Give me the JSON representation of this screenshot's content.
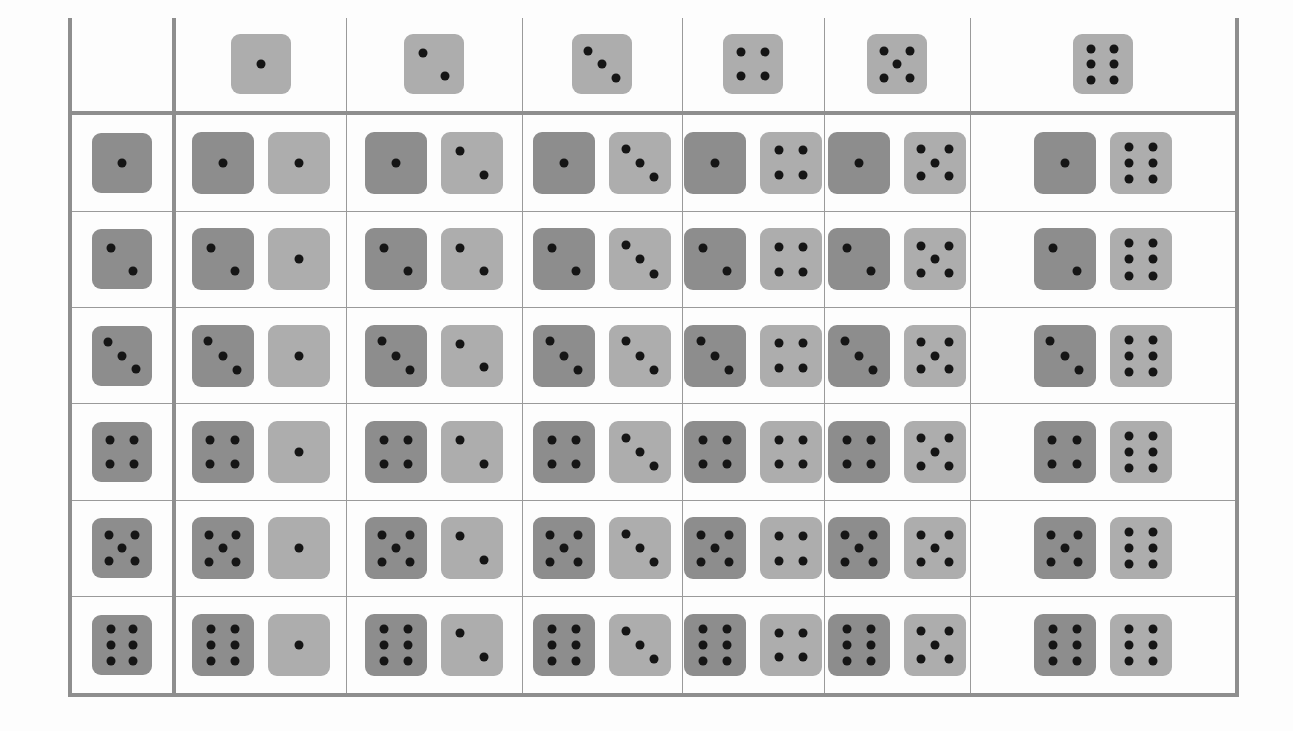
{
  "figure": {
    "kind": "dice-sample-space-table",
    "rows": 6,
    "columns": 6,
    "row_header_label": "first-die",
    "column_header_label": "second-die"
  },
  "colors": {
    "die_first": "#8d8d8d",
    "die_second": "#adadad",
    "pip": "#151515",
    "grid_thick": "#8e8e8e",
    "grid_thin": "#9a9a9a",
    "background": "#fdfdfd"
  },
  "pip_layouts": {
    "1": [
      [
        50,
        50
      ]
    ],
    "2": [
      [
        31,
        31
      ],
      [
        69,
        69
      ]
    ],
    "3": [
      [
        27,
        27
      ],
      [
        50,
        50
      ],
      [
        73,
        73
      ]
    ],
    "4": [
      [
        30,
        30
      ],
      [
        70,
        30
      ],
      [
        30,
        70
      ],
      [
        70,
        70
      ]
    ],
    "5": [
      [
        28,
        28
      ],
      [
        72,
        28
      ],
      [
        50,
        50
      ],
      [
        28,
        72
      ],
      [
        72,
        72
      ]
    ],
    "6": [
      [
        31,
        24
      ],
      [
        69,
        24
      ],
      [
        31,
        50
      ],
      [
        69,
        50
      ],
      [
        31,
        76
      ],
      [
        69,
        76
      ]
    ]
  },
  "column_headers": [
    {
      "name": "column-header-1",
      "value": 1,
      "shade": "light"
    },
    {
      "name": "column-header-2",
      "value": 2,
      "shade": "light"
    },
    {
      "name": "column-header-3",
      "value": 3,
      "shade": "light"
    },
    {
      "name": "column-header-4",
      "value": 4,
      "shade": "light"
    },
    {
      "name": "column-header-5",
      "value": 5,
      "shade": "light"
    },
    {
      "name": "column-header-6",
      "value": 6,
      "shade": "light"
    }
  ],
  "row_headers": [
    {
      "name": "row-header-1",
      "value": 1,
      "shade": "dark"
    },
    {
      "name": "row-header-2",
      "value": 2,
      "shade": "dark"
    },
    {
      "name": "row-header-3",
      "value": 3,
      "shade": "dark"
    },
    {
      "name": "row-header-4",
      "value": 4,
      "shade": "dark"
    },
    {
      "name": "row-header-5",
      "value": 5,
      "shade": "dark"
    },
    {
      "name": "row-header-6",
      "value": 6,
      "shade": "dark"
    }
  ],
  "cells": [
    [
      {
        "first": 1,
        "second": 1,
        "sum": 2
      },
      {
        "first": 1,
        "second": 2,
        "sum": 3
      },
      {
        "first": 1,
        "second": 3,
        "sum": 4
      },
      {
        "first": 1,
        "second": 4,
        "sum": 5
      },
      {
        "first": 1,
        "second": 5,
        "sum": 6
      },
      {
        "first": 1,
        "second": 6,
        "sum": 7
      }
    ],
    [
      {
        "first": 2,
        "second": 1,
        "sum": 3
      },
      {
        "first": 2,
        "second": 2,
        "sum": 4
      },
      {
        "first": 2,
        "second": 3,
        "sum": 5
      },
      {
        "first": 2,
        "second": 4,
        "sum": 6
      },
      {
        "first": 2,
        "second": 5,
        "sum": 7
      },
      {
        "first": 2,
        "second": 6,
        "sum": 8
      }
    ],
    [
      {
        "first": 3,
        "second": 1,
        "sum": 4
      },
      {
        "first": 3,
        "second": 2,
        "sum": 5
      },
      {
        "first": 3,
        "second": 3,
        "sum": 6
      },
      {
        "first": 3,
        "second": 4,
        "sum": 7
      },
      {
        "first": 3,
        "second": 5,
        "sum": 8
      },
      {
        "first": 3,
        "second": 6,
        "sum": 9
      }
    ],
    [
      {
        "first": 4,
        "second": 1,
        "sum": 5
      },
      {
        "first": 4,
        "second": 2,
        "sum": 6
      },
      {
        "first": 4,
        "second": 3,
        "sum": 7
      },
      {
        "first": 4,
        "second": 4,
        "sum": 8
      },
      {
        "first": 4,
        "second": 5,
        "sum": 9
      },
      {
        "first": 4,
        "second": 6,
        "sum": 10
      }
    ],
    [
      {
        "first": 5,
        "second": 1,
        "sum": 6
      },
      {
        "first": 5,
        "second": 2,
        "sum": 7
      },
      {
        "first": 5,
        "second": 3,
        "sum": 8
      },
      {
        "first": 5,
        "second": 4,
        "sum": 9
      },
      {
        "first": 5,
        "second": 5,
        "sum": 10
      },
      {
        "first": 5,
        "second": 6,
        "sum": 11
      }
    ],
    [
      {
        "first": 6,
        "second": 1,
        "sum": 7
      },
      {
        "first": 6,
        "second": 2,
        "sum": 8
      },
      {
        "first": 6,
        "second": 3,
        "sum": 9
      },
      {
        "first": 6,
        "second": 4,
        "sum": 10
      },
      {
        "first": 6,
        "second": 5,
        "sum": 11
      },
      {
        "first": 6,
        "second": 6,
        "sum": 12
      }
    ]
  ]
}
